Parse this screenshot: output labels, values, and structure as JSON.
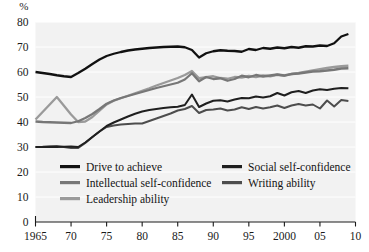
{
  "chart_data": {
    "type": "line",
    "title": "",
    "subtitle": "",
    "xlabel": "",
    "ylabel": "",
    "unit_label": "%",
    "xlim": [
      1965,
      2010
    ],
    "ylim": [
      0,
      80
    ],
    "ytick_step": 10,
    "grid": true,
    "grid_axis": "y",
    "legend_position": "inside-bottom-left",
    "x_tick_values": [
      1965,
      1970,
      1975,
      1980,
      1985,
      1990,
      1995,
      2000,
      2005,
      2010
    ],
    "x_tick_labels": [
      "1965",
      "70",
      "75",
      "80",
      "85",
      "90",
      "95",
      "2000",
      "05",
      "10"
    ],
    "y_tick_values": [
      0,
      10,
      20,
      30,
      40,
      50,
      60,
      70,
      80
    ],
    "y_tick_labels": [
      "0",
      "10",
      "20",
      "30",
      "40",
      "50",
      "60",
      "70",
      "80"
    ],
    "x": [
      1965,
      1966,
      1967,
      1968,
      1969,
      1970,
      1971,
      1972,
      1973,
      1974,
      1975,
      1976,
      1977,
      1978,
      1979,
      1980,
      1981,
      1982,
      1983,
      1984,
      1985,
      1986,
      1987,
      1988,
      1989,
      1990,
      1991,
      1992,
      1993,
      1994,
      1995,
      1996,
      1997,
      1998,
      1999,
      2000,
      2001,
      2002,
      2003,
      2004,
      2005,
      2006,
      2007,
      2008,
      2009
    ],
    "series": [
      {
        "name": "Drive to achieve",
        "color": "#111111",
        "width": 2.3,
        "values": [
          60.0,
          59.6,
          59.2,
          58.7,
          58.3,
          58.0,
          59.6,
          61.3,
          63.2,
          65.0,
          66.4,
          67.3,
          68.0,
          68.6,
          69.0,
          69.3,
          69.6,
          69.8,
          70.0,
          70.1,
          70.2,
          69.9,
          68.8,
          65.8,
          67.5,
          68.3,
          68.7,
          68.5,
          68.4,
          68.1,
          69.2,
          68.8,
          69.6,
          69.3,
          69.8,
          69.5,
          70.0,
          69.7,
          70.3,
          70.2,
          70.6,
          70.4,
          71.5,
          74.2,
          75.2
        ]
      },
      {
        "name": "Intellectual self-confidence",
        "color": "#777777",
        "width": 2.3,
        "values": [
          40.2,
          40.0,
          39.9,
          39.8,
          39.7,
          39.6,
          40.3,
          41.6,
          43.2,
          45.2,
          47.3,
          48.6,
          49.6,
          50.4,
          51.2,
          52.0,
          52.8,
          53.6,
          54.3,
          55.0,
          55.7,
          57.0,
          59.5,
          56.3,
          58.0,
          57.2,
          57.5,
          56.5,
          57.2,
          58.5,
          57.9,
          58.8,
          58.2,
          58.6,
          59.0,
          58.6,
          59.2,
          59.4,
          59.8,
          60.2,
          60.3,
          60.6,
          60.9,
          61.4,
          61.5
        ]
      },
      {
        "name": "Leadership ability",
        "color": "#9a9a9a",
        "width": 2.3,
        "values": [
          41.0,
          44.0,
          47.0,
          50.0,
          46.5,
          43.0,
          40.0,
          40.2,
          42.0,
          44.5,
          47.0,
          48.5,
          49.5,
          50.5,
          51.5,
          52.5,
          53.5,
          54.6,
          55.6,
          56.6,
          57.6,
          58.8,
          60.4,
          57.5,
          57.9,
          58.3,
          57.6,
          57.3,
          58.0,
          57.8,
          58.4,
          58.0,
          58.6,
          58.3,
          58.9,
          58.5,
          59.2,
          59.6,
          60.1,
          60.6,
          61.1,
          61.6,
          62.0,
          62.3,
          62.5
        ]
      },
      {
        "name": "Social self-confidence",
        "color": "#1f1f1f",
        "width": 2.0,
        "values": [
          30.0,
          30.0,
          30.0,
          30.0,
          30.1,
          30.2,
          30.0,
          31.8,
          34.0,
          36.2,
          38.4,
          39.8,
          41.0,
          42.2,
          43.3,
          44.2,
          44.8,
          45.2,
          45.6,
          45.9,
          46.1,
          46.8,
          51.0,
          46.0,
          47.4,
          48.5,
          48.7,
          48.2,
          49.0,
          49.6,
          49.5,
          50.2,
          49.8,
          50.3,
          51.6,
          50.6,
          51.9,
          52.4,
          51.6,
          52.6,
          53.1,
          52.8,
          53.3,
          53.6,
          53.5
        ]
      },
      {
        "name": "Writing ability",
        "color": "#4d4d4d",
        "width": 2.0,
        "values": [
          30.0,
          30.1,
          30.3,
          30.4,
          30.0,
          29.6,
          29.6,
          31.6,
          34.0,
          36.2,
          38.0,
          38.6,
          39.0,
          39.2,
          39.4,
          39.4,
          40.4,
          41.4,
          42.4,
          43.4,
          44.6,
          45.2,
          46.4,
          43.6,
          44.8,
          45.0,
          45.4,
          44.6,
          45.0,
          45.9,
          45.2,
          46.0,
          45.4,
          45.9,
          46.6,
          45.6,
          46.6,
          47.2,
          46.6,
          47.0,
          45.4,
          48.6,
          46.2,
          48.8,
          48.4
        ]
      }
    ],
    "legend_entries": [
      {
        "label": "Drive to achieve",
        "color": "#111111",
        "column": 0,
        "row": 0
      },
      {
        "label": "Intellectual self-confidence",
        "color": "#777777",
        "column": 0,
        "row": 1
      },
      {
        "label": "Leadership ability",
        "color": "#9a9a9a",
        "column": 0,
        "row": 2
      },
      {
        "label": "Social self-confidence",
        "color": "#1f1f1f",
        "column": 1,
        "row": 0
      },
      {
        "label": "Writing ability",
        "color": "#4d4d4d",
        "column": 1,
        "row": 1
      }
    ],
    "colors": {
      "plot_background": "#f2f2f2",
      "page_background": "#ffffff",
      "axis": "#1a1a1a",
      "gridline": "#ffffff"
    }
  }
}
